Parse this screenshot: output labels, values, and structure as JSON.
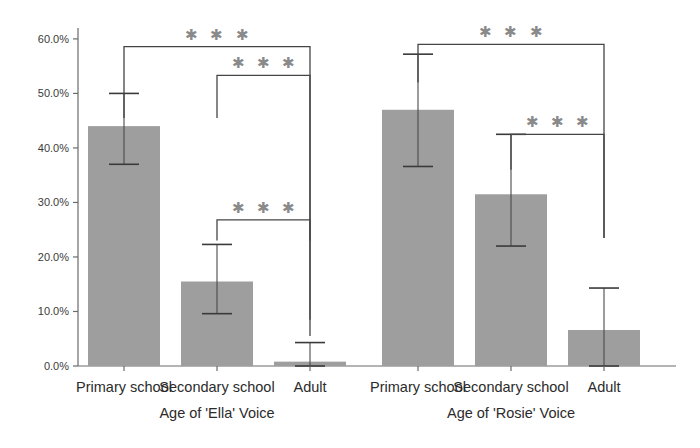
{
  "chart_data": {
    "type": "bar",
    "title": "",
    "xlabel": "",
    "ylabel": "",
    "ylim": [
      0,
      62
    ],
    "grid": false,
    "legend": "none",
    "y_tick_labels": [
      "0.0%",
      "10.0%",
      "20.0%",
      "30.0%",
      "40.0%",
      "50.0%",
      "60.0%"
    ],
    "y_tick_values": [
      0,
      10,
      20,
      30,
      40,
      50,
      60
    ],
    "categories": [
      "Primary school",
      "Secondary school",
      "Adult"
    ],
    "panels": [
      {
        "name": "ella",
        "group_label": "Age of 'Ella' Voice",
        "values": [
          44.0,
          15.5,
          0.8
        ],
        "error_low": [
          37.0,
          9.6,
          0.0
        ],
        "error_high": [
          50.0,
          22.3,
          4.3
        ],
        "significance": [
          {
            "from": 0,
            "to": 2,
            "level": 58.6,
            "stars": "✱ ✱ ✱",
            "drop_from": 45.5,
            "drop_to": 8.5
          },
          {
            "from": 1,
            "to": 2,
            "level": 53.3,
            "stars": "✱ ✱ ✱",
            "drop_from": 45.5,
            "drop_to": 23.0
          },
          {
            "from": 1,
            "to": 2,
            "level": 26.8,
            "stars": "✱ ✱ ✱",
            "drop_from": 23.0,
            "drop_to": 5.5
          }
        ]
      },
      {
        "name": "rosie",
        "group_label": "Age of 'Rosie' Voice",
        "values": [
          47.0,
          31.5,
          6.6
        ],
        "error_low": [
          36.6,
          22.0,
          0.0
        ],
        "error_high": [
          57.2,
          42.5,
          14.3
        ],
        "significance": [
          {
            "from": 0,
            "to": 2,
            "level": 59.0,
            "stars": "✱ ✱ ✱",
            "drop_from": 52.0,
            "drop_to": 23.5
          },
          {
            "from": 1,
            "to": 2,
            "level": 42.5,
            "stars": "✱ ✱ ✱",
            "drop_from": 36.0,
            "drop_to": 23.5
          }
        ]
      }
    ],
    "colors": {
      "bar_fill": "#9e9e9e",
      "axis": "#6b6b6b",
      "error_bar": "#4a4a4a",
      "bracket": "#454545",
      "stars": "#8a8a8a",
      "text": "#2b2b2b",
      "background": "#ffffff"
    }
  }
}
